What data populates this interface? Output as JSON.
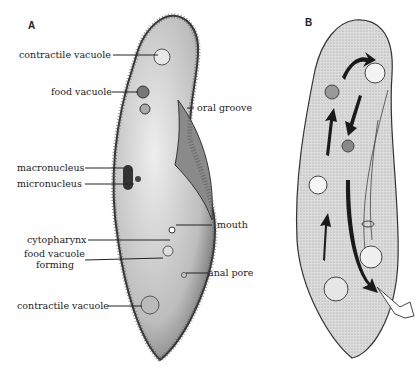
{
  "panels": {
    "a": {
      "letter": "A"
    },
    "b": {
      "letter": "B"
    }
  },
  "labels": {
    "contractile_vacuole_top": "contractile vacuole",
    "food_vacuole": "food vacuole",
    "oral_groove": "oral groove",
    "macronucleus": "macronucleus",
    "micronucleus": "micronucleus",
    "mouth": "mouth",
    "cytopharynx": "cytopharynx",
    "food_vacuole_forming_1": "food vacuole",
    "food_vacuole_forming_2": "forming",
    "anal_pore": "anal pore",
    "contractile_vacuole_bottom": "contractile vacuole"
  },
  "colors": {
    "ink": "#222222",
    "body_fill_a": "#d6d6d6",
    "body_fill_b": "#d9d9d9"
  }
}
